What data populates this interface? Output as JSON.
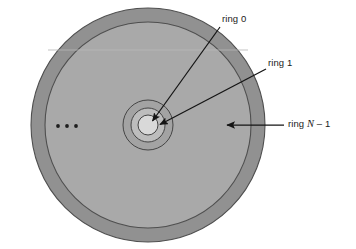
{
  "figure": {
    "type": "concentric-ring-disk-diagram",
    "title_visible": false,
    "center": {
      "x": 148,
      "y": 125
    },
    "colors": {
      "background": "#ffffff",
      "outer_ring_band": "#919191",
      "disk_body": "#a9a9a9",
      "ring_band_2": "#a0a0a0",
      "ring_band_1": "#bcbcbc",
      "ring_0_fill": "#d9d9d9",
      "stroke": "#4a4a4a",
      "arrow": "#141414",
      "text": "#1a1a1a"
    },
    "circles": [
      {
        "name": "outer-boundary",
        "radius": 117,
        "fill": "#919191"
      },
      {
        "name": "ring-n-1-inner-boundary",
        "radius": 103,
        "fill": "#a9a9a9"
      },
      {
        "name": "ring-2-boundary",
        "radius": 25,
        "fill": "#a3a3a3"
      },
      {
        "name": "ring-1-boundary",
        "radius": 17,
        "fill": "#bdbdbd"
      },
      {
        "name": "ring-0-boundary",
        "radius": 10,
        "fill": "#d9d9d9"
      }
    ],
    "ellipsis": {
      "dots": 3,
      "x_positions": [
        58,
        67,
        76
      ],
      "y": 126,
      "radius": 1.8
    }
  },
  "labels": {
    "ring_0": "ring 0",
    "ring_1": "ring 1",
    "ring_n_minus_1_prefix": "ring ",
    "ring_n_minus_1_italic": "N",
    "ring_n_minus_1_suffix": " – 1"
  },
  "annotations": [
    {
      "name": "ring-0-annotation",
      "label_key": "ring_0",
      "label_position": {
        "x": 222,
        "y": 13
      },
      "arrow": {
        "x1": 220,
        "y1": 28,
        "x2": 151,
        "y2": 122
      }
    },
    {
      "name": "ring-1-annotation",
      "label_key": "ring_1",
      "label_position": {
        "x": 268,
        "y": 57
      },
      "arrow": {
        "x1": 266,
        "y1": 70,
        "x2": 159,
        "y2": 124
      }
    },
    {
      "name": "ring-n-1-annotation",
      "label_key": "ring_n_minus_1",
      "label_position": {
        "x": 288,
        "y": 118
      },
      "arrow": {
        "x1": 285,
        "y1": 125,
        "x2": 226,
        "y2": 125
      }
    }
  ]
}
